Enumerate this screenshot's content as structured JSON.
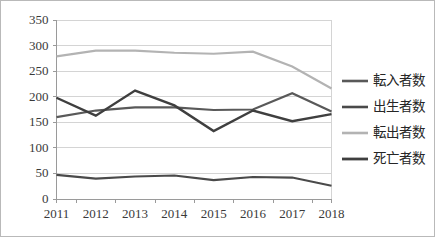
{
  "chart_data": {
    "type": "line",
    "title": "",
    "xlabel": "",
    "ylabel": "",
    "categories": [
      "2011",
      "2012",
      "2013",
      "2014",
      "2015",
      "2016",
      "2017",
      "2018"
    ],
    "ylim": [
      0,
      350
    ],
    "yticks": [
      "0",
      "50",
      "100",
      "150",
      "200",
      "250",
      "300",
      "350"
    ],
    "grid": true,
    "legend_position": "right",
    "series": [
      {
        "name": "転入者数",
        "color": "#595959",
        "width": 2.2,
        "values": [
          159,
          172,
          178,
          178,
          173,
          174,
          206,
          170
        ]
      },
      {
        "name": "出生者数",
        "color": "#4a4a4a",
        "width": 2.2,
        "values": [
          46,
          39,
          43,
          45,
          36,
          42,
          41,
          25
        ]
      },
      {
        "name": "転出者数",
        "color": "#b3b3b3",
        "width": 2.2,
        "values": [
          278,
          289,
          289,
          285,
          283,
          287,
          258,
          215
        ]
      },
      {
        "name": "死亡者数",
        "color": "#3f3f3f",
        "width": 2.4,
        "values": [
          197,
          162,
          211,
          182,
          132,
          172,
          151,
          165
        ]
      }
    ]
  },
  "legend": {
    "items": [
      {
        "label": "転入者数"
      },
      {
        "label": "出生者数"
      },
      {
        "label": "転出者数"
      },
      {
        "label": "死亡者数"
      }
    ]
  },
  "axes": {
    "y_labels": [
      "350",
      "300",
      "250",
      "200",
      "150",
      "100",
      "50",
      "0"
    ],
    "x_labels": [
      "2011",
      "2012",
      "2013",
      "2014",
      "2015",
      "2016",
      "2017",
      "2018"
    ]
  },
  "colors": {
    "frame_border": "#b9b9b9",
    "gridline": "#d4d4d4",
    "axis": "#9a9a9a",
    "background": "#ffffff",
    "text": "#3a3a3a"
  }
}
